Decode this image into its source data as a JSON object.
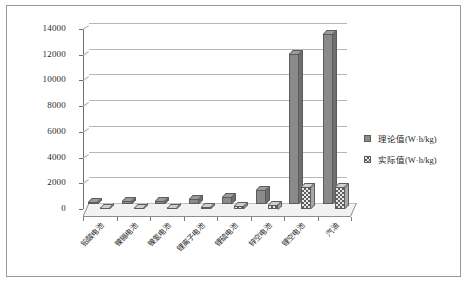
{
  "chart_data": {
    "type": "bar",
    "title": "",
    "xlabel": "",
    "ylabel": "",
    "ylim": [
      0,
      14000
    ],
    "ytick_values": [
      0,
      2000,
      4000,
      6000,
      8000,
      10000,
      12000,
      14000
    ],
    "ytick_labels": [
      "0",
      "2000",
      "4000",
      "6000",
      "8000",
      "10000",
      "12000",
      "14000"
    ],
    "grid": true,
    "legend_position": "right",
    "categories": [
      "铅酸电池",
      "镍镉电池",
      "镍氢电池",
      "锂离子电池",
      "锂硫电池",
      "锌空电池",
      "锂空电池",
      "汽油"
    ],
    "series": [
      {
        "name": "理论值(W·h/kg)",
        "values": [
          170,
          210,
          240,
          390,
          580,
          1080,
          11700,
          13200
        ],
        "color": "#8a8a8a",
        "fill": "solid"
      },
      {
        "name": "实际值(W·h/kg)",
        "values": [
          40,
          55,
          75,
          160,
          200,
          350,
          1700,
          1700
        ],
        "color": "#e8e8e8",
        "fill": "hatched"
      }
    ]
  },
  "legend": {
    "items": [
      {
        "label": "理论值(W·h/kg)",
        "swatch": "solid-gray-square"
      },
      {
        "label": "实际值(W·h/kg)",
        "swatch": "hatched-square"
      }
    ]
  },
  "colors": {
    "frame_border": "#9a9a9a",
    "axis": "#6f6f6f",
    "gridline": "#b7b7b7",
    "series_theory": "#8a8a8a",
    "series_actual": "#e8e8e8",
    "floor": "#f2f2f2",
    "text": "#1f1f1f"
  }
}
